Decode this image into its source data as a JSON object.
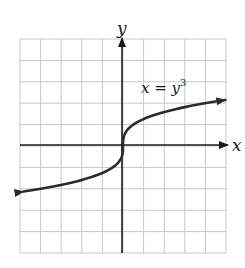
{
  "chart_data": {
    "type": "line",
    "title": "",
    "equation_label": "x = y",
    "equation_exponent": "3",
    "xlabel": "x",
    "ylabel": "y",
    "grid": true,
    "grid_columns": 10,
    "grid_rows": 10,
    "x_per_grid": 2,
    "y_per_grid": 1,
    "xlim": [
      -10,
      10
    ],
    "ylim": [
      -5,
      5
    ],
    "series": [
      {
        "name": "x = y^3",
        "color": "#2b2b2b",
        "arrows": "both",
        "y_range": [
          -2.13,
          2.15
        ]
      }
    ]
  },
  "colors": {
    "grid": "#c8c8c8",
    "axis": "#1a1a1a",
    "curve": "#2b2b2b"
  }
}
